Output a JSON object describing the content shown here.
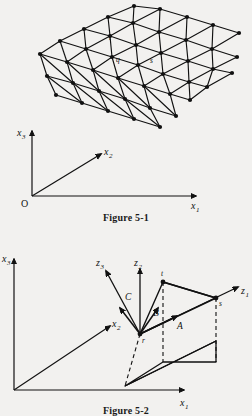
{
  "page": {
    "background_color": "#f2f1ef",
    "ink_color": "#111111"
  },
  "figure1": {
    "caption": "Figure 5-1",
    "description": "Triangulated curved surface mesh above a 3D coordinate frame",
    "axes": {
      "origin_label": "O",
      "x1": {
        "base": "x",
        "sub": "1"
      },
      "x2": {
        "base": "x",
        "sub": "2"
      },
      "x3": {
        "base": "x",
        "sub": "3"
      }
    },
    "node_labels": [
      {
        "name": "t",
        "x": 112,
        "y": 38
      },
      {
        "name": "q",
        "x": 119,
        "y": 60
      },
      {
        "name": "s",
        "x": 152,
        "y": 62
      },
      {
        "name": "r",
        "x": 120,
        "y": 78
      }
    ],
    "mesh": {
      "points": [
        [
          134,
          6
        ],
        [
          160,
          9
        ],
        [
          187,
          17
        ],
        [
          213,
          25
        ],
        [
          239,
          33
        ],
        [
          108,
          17
        ],
        [
          133,
          23
        ],
        [
          159,
          32
        ],
        [
          186,
          40
        ],
        [
          212,
          49
        ],
        [
          237,
          57
        ],
        [
          84,
          29
        ],
        [
          110,
          36
        ],
        [
          136,
          45
        ],
        [
          161,
          53
        ],
        [
          188,
          61
        ],
        [
          213,
          69
        ],
        [
          232,
          73
        ],
        [
          60,
          41
        ],
        [
          86,
          49
        ],
        [
          112,
          57
        ],
        [
          138,
          65
        ],
        [
          163,
          74
        ],
        [
          189,
          82
        ],
        [
          207,
          87
        ],
        [
          40,
          54
        ],
        [
          67,
          62
        ],
        [
          93,
          70
        ],
        [
          118,
          78
        ],
        [
          144,
          86
        ],
        [
          170,
          94
        ],
        [
          190,
          100
        ],
        [
          47,
          76
        ],
        [
          73,
          83
        ],
        [
          99,
          91
        ],
        [
          125,
          99
        ],
        [
          150,
          108
        ],
        [
          176,
          116
        ],
        [
          56,
          95
        ],
        [
          82,
          103
        ],
        [
          108,
          111
        ],
        [
          134,
          119
        ],
        [
          160,
          127
        ]
      ]
    }
  },
  "figure2": {
    "caption": "Figure 5-2",
    "description": "Local z-frame at point r with vectors A, B, C and projection onto the x1-x2 plane",
    "axes": {
      "origin_label": "",
      "x1": {
        "base": "x",
        "sub": "1"
      },
      "x2": {
        "base": "x",
        "sub": "2"
      },
      "x3": {
        "base": "x",
        "sub": "3"
      }
    },
    "local_axes": [
      {
        "base": "z",
        "sub": "1"
      },
      {
        "base": "z",
        "sub": "2"
      },
      {
        "base": "z",
        "sub": "3"
      }
    ],
    "vectors": [
      {
        "name": "A"
      },
      {
        "name": "B"
      },
      {
        "name": "C"
      }
    ],
    "points": [
      {
        "name": "r"
      },
      {
        "name": "s"
      },
      {
        "name": "t"
      }
    ]
  }
}
